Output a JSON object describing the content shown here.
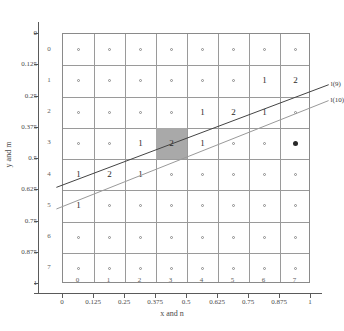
{
  "chart_data": {
    "type": "heatmap",
    "title": "",
    "xlabel": "x and n",
    "ylabel": "y and m",
    "xlim": [
      0,
      1
    ],
    "ylim": [
      0,
      1
    ],
    "grid": true,
    "legend_position": "right-outside",
    "x_tick_labels": [
      "0",
      "0.125",
      "0.25",
      "0.375",
      "0.5",
      "0.625",
      "0.75",
      "0.875",
      "1"
    ],
    "x_tick_values": [
      0,
      0.125,
      0.25,
      0.375,
      0.5,
      0.625,
      0.75,
      0.875,
      1
    ],
    "y_tick_labels": [
      "0",
      "0.125",
      "0.25",
      "0.375",
      "0.5",
      "0.625",
      "0.75",
      "0.875",
      "1"
    ],
    "y_tick_values": [
      0,
      0.125,
      0.25,
      0.375,
      0.5,
      0.625,
      0.75,
      0.875,
      1
    ],
    "col_indices": [
      "0",
      "1",
      "2",
      "3",
      "4",
      "5",
      "6",
      "7"
    ],
    "row_indices": [
      "0",
      "1",
      "2",
      "3",
      "4",
      "5",
      "6",
      "7"
    ],
    "cell_marker": "o",
    "cells": [
      [
        "o",
        "o",
        "o",
        "o",
        "o",
        "o",
        "o",
        "o"
      ],
      [
        "o",
        "o",
        "o",
        "o",
        "o",
        "o",
        "1",
        "2"
      ],
      [
        "o",
        "o",
        "o",
        "o",
        "1",
        "2",
        "1",
        "o"
      ],
      [
        "o",
        "o",
        "1",
        "2",
        "1",
        "o",
        "o",
        "o"
      ],
      [
        "1",
        "2",
        "1",
        "o",
        "o",
        "o",
        "o",
        "o"
      ],
      [
        "1",
        "o",
        "o",
        "o",
        "o",
        "o",
        "o",
        "o"
      ],
      [
        "o",
        "o",
        "o",
        "o",
        "o",
        "o",
        "o",
        "o"
      ],
      [
        "o",
        "o",
        "o",
        "o",
        "o",
        "o",
        "o",
        "o"
      ]
    ],
    "shaded_cell": {
      "col": 3,
      "row": 3,
      "color": "#a9a9a9"
    },
    "filled_marker_cell": {
      "col": 7,
      "row": 3
    },
    "lines": [
      {
        "label": "l(9)",
        "color": "#444444",
        "x0": 0.0,
        "y0": 0.609,
        "x1": 1.0,
        "y1": 0.235
      },
      {
        "label": "l(10)",
        "color": "#9a9a9a",
        "x0": 0.0,
        "y0": 0.695,
        "x1": 1.0,
        "y1": 0.3
      }
    ]
  }
}
